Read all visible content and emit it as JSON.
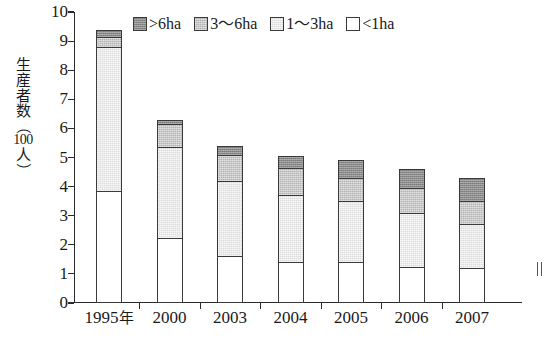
{
  "chart_data": {
    "type": "bar",
    "stacked": true,
    "title": "",
    "xlabel": "",
    "ylabel": "生産者数（100人）",
    "ylabel_chars": [
      "生",
      "産",
      "者",
      "数"
    ],
    "ylabel_unit": "（100人）",
    "ylabel_unit_num": "100",
    "ylabel_unit_person": "人",
    "ylim": [
      0,
      10
    ],
    "yticks": [
      0,
      1,
      2,
      3,
      4,
      5,
      6,
      7,
      8,
      9,
      10
    ],
    "ytick_labels": [
      "0",
      "1",
      "2",
      "3",
      "4",
      "5",
      "6",
      "7",
      "8",
      "9",
      "10"
    ],
    "grid": false,
    "legend_position": "top-center",
    "categories": [
      "1995年",
      "2000",
      "2003",
      "2004",
      "2005",
      "2006",
      "2007"
    ],
    "category_labels": [
      "1995",
      "2000",
      "2003",
      "2004",
      "2005",
      "2006",
      "2007"
    ],
    "first_category_unit": "年",
    "series": [
      {
        "name": "<1ha",
        "key": "lt1",
        "color": "#ffffff",
        "values": [
          3.85,
          2.25,
          1.6,
          1.4,
          1.4,
          1.25,
          1.2
        ]
      },
      {
        "name": "1〜3ha",
        "key": "s1_3",
        "color": "#dcdcdc",
        "values": [
          4.95,
          3.1,
          2.6,
          2.3,
          2.1,
          1.85,
          1.5
        ]
      },
      {
        "name": "3〜6ha",
        "key": "s3_6",
        "color": "#b3b3b3",
        "values": [
          0.35,
          0.8,
          0.9,
          0.95,
          0.8,
          0.85,
          0.8
        ]
      },
      {
        "name": ">6ha",
        "key": "gt6",
        "color": "#8a8a8a",
        "values": [
          0.25,
          0.15,
          0.3,
          0.4,
          0.6,
          0.65,
          0.8
        ]
      }
    ],
    "totals": [
      9.4,
      6.3,
      5.4,
      5.05,
      4.9,
      4.6,
      4.3
    ],
    "cumulative_tops": {
      "1995年": [
        3.85,
        8.8,
        9.15,
        9.4
      ],
      "2000": [
        2.25,
        5.35,
        6.15,
        6.3
      ],
      "2003": [
        1.6,
        4.2,
        5.1,
        5.4
      ],
      "2004": [
        1.4,
        3.7,
        4.65,
        5.05
      ],
      "2005": [
        1.4,
        3.5,
        4.3,
        4.9
      ],
      "2006": [
        1.25,
        3.1,
        3.95,
        4.6
      ],
      "2007": [
        1.2,
        2.7,
        3.5,
        4.3
      ]
    }
  },
  "legend": {
    "items": [
      {
        "label": ">6ha",
        "swatch": "#8a8a8a",
        "icon": "legend-swatch-gt6"
      },
      {
        "label": "3〜6ha",
        "swatch": "#b3b3b3",
        "icon": "legend-swatch-3-6"
      },
      {
        "label": "1〜3ha",
        "swatch": "#dcdcdc",
        "icon": "legend-swatch-1-3"
      },
      {
        "label": "<1ha",
        "swatch": "#ffffff",
        "icon": "legend-swatch-lt1"
      }
    ]
  },
  "colors": {
    "axis": "#2b2b2b",
    "outline": "#3a3a3a",
    "background": "#ffffff",
    "gt6": "#8a8a8a",
    "s3_6": "#b3b3b3",
    "s1_3": "#dcdcdc",
    "lt1": "#ffffff"
  }
}
